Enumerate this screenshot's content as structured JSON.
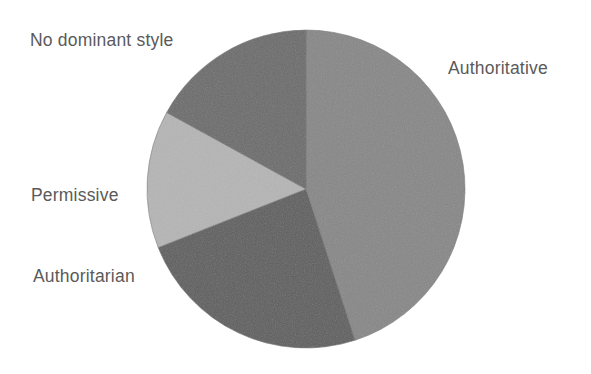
{
  "figure": {
    "background_color": "#ffffff",
    "width": 591,
    "height": 374
  },
  "chart_data": {
    "type": "pie",
    "title": "",
    "subtitle": "",
    "xlabel": "",
    "ylabel": "",
    "legend_position": "none",
    "labels_position": "outside-callout-free",
    "start_angle_deg": 0,
    "direction": "clockwise",
    "grid": false,
    "categories": [
      "Authoritative",
      "Authoritarian",
      "Permissive",
      "No dominant style"
    ],
    "values": [
      45,
      24,
      14,
      17
    ],
    "units": "percent",
    "slices": [
      {
        "label": "Authoritative",
        "value": 45,
        "start_angle_deg": 0,
        "end_angle_deg": 162,
        "color": "#878787"
      },
      {
        "label": "Authoritarian",
        "value": 24,
        "start_angle_deg": 162,
        "end_angle_deg": 248.4,
        "color": "#5e5e5e"
      },
      {
        "label": "Permissive",
        "value": 14,
        "start_angle_deg": 248.4,
        "end_angle_deg": 298.8,
        "color": "#b5b5b5"
      },
      {
        "label": "No dominant style",
        "value": 17,
        "start_angle_deg": 298.8,
        "end_angle_deg": 360,
        "color": "#6b6b6b"
      }
    ],
    "geometry": {
      "center_x": 306,
      "center_y": 189,
      "radius": 159
    },
    "colors": {
      "authoritative": "#878787",
      "authoritarian": "#5e5e5e",
      "permissive": "#b5b5b5",
      "no_dominant_style": "#6b6b6b",
      "label_text": "#5a5a5a",
      "outline": "#777777"
    }
  },
  "labels": {
    "no_dominant_style": "No dominant style",
    "authoritative": "Authoritative",
    "permissive": "Permissive",
    "authoritarian": "Authoritarian"
  }
}
